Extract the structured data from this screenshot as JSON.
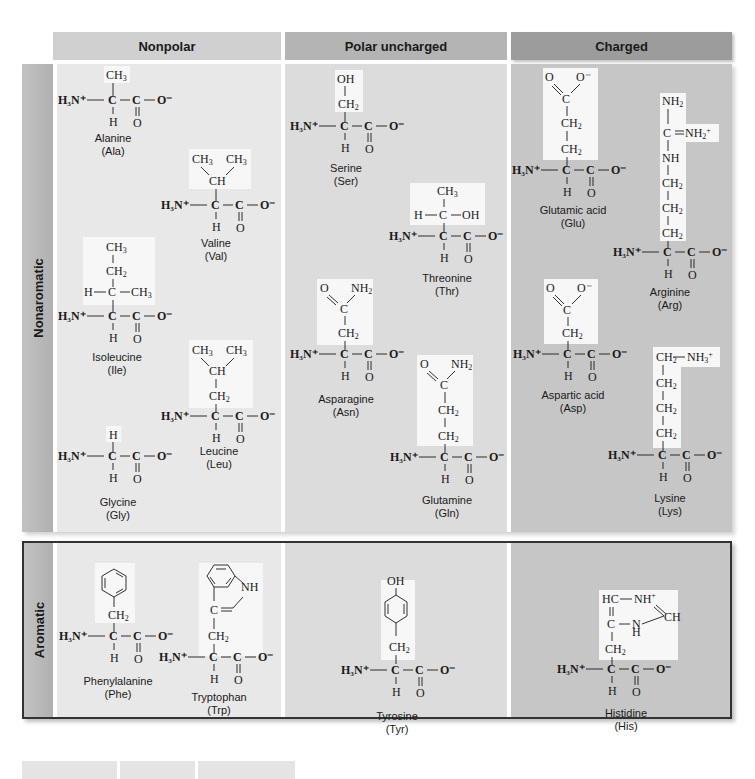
{
  "columns": {
    "nonpolar": "Nonpolar",
    "polar_uncharged": "Polar uncharged",
    "charged": "Charged"
  },
  "rows": {
    "nonaromatic": "Nonaromatic",
    "aromatic": "Aromatic"
  },
  "colors": {
    "nonpolar_header": "#d0d0d0",
    "polar_header": "#b4b4b4",
    "charged_header": "#9c9c9c",
    "nonpolar_cell": "#e8e8e8",
    "polar_cell": "#dcdcdc",
    "charged_cell": "#c6c6c6",
    "sidechain_highlight": "#f7f7f7"
  },
  "backbone": {
    "amine": "H₃N⁺",
    "alpha_c": "C",
    "carboxyl_c": "C",
    "carboxyl_o": "O⁻",
    "h": "H",
    "o": "O"
  },
  "amino_acids": {
    "ala": {
      "name": "Alanine",
      "abbr": "(Ala)",
      "group": "nonpolar",
      "row": "nonaromatic",
      "side_chain": [
        "CH₃"
      ]
    },
    "val": {
      "name": "Valine",
      "abbr": "(Val)",
      "group": "nonpolar",
      "row": "nonaromatic",
      "side_chain": [
        "CH₃",
        "CH₃",
        "CH"
      ]
    },
    "ile": {
      "name": "Isoleucine",
      "abbr": "(Ile)",
      "group": "nonpolar",
      "row": "nonaromatic",
      "side_chain": [
        "CH₃",
        "CH₂",
        "H",
        "C",
        "CH₃"
      ]
    },
    "leu": {
      "name": "Leucine",
      "abbr": "(Leu)",
      "group": "nonpolar",
      "row": "nonaromatic",
      "side_chain": [
        "CH₃",
        "CH₃",
        "CH",
        "CH₂"
      ]
    },
    "gly": {
      "name": "Glycine",
      "abbr": "(Gly)",
      "group": "nonpolar",
      "row": "nonaromatic",
      "side_chain": [
        "H"
      ]
    },
    "ser": {
      "name": "Serine",
      "abbr": "(Ser)",
      "group": "polar_uncharged",
      "row": "nonaromatic",
      "side_chain": [
        "OH",
        "CH₂"
      ]
    },
    "thr": {
      "name": "Threonine",
      "abbr": "(Thr)",
      "group": "polar_uncharged",
      "row": "nonaromatic",
      "side_chain": [
        "CH₃",
        "H",
        "C",
        "OH"
      ]
    },
    "asn": {
      "name": "Asparagine",
      "abbr": "(Asn)",
      "group": "polar_uncharged",
      "row": "nonaromatic",
      "side_chain": [
        "O",
        "NH₂",
        "C",
        "CH₂"
      ]
    },
    "gln": {
      "name": "Glutamine",
      "abbr": "(Gln)",
      "group": "polar_uncharged",
      "row": "nonaromatic",
      "side_chain": [
        "O",
        "NH₂",
        "C",
        "CH₂",
        "CH₂"
      ]
    },
    "glu": {
      "name": "Glutamic acid",
      "abbr": "(Glu)",
      "group": "charged",
      "row": "nonaromatic",
      "side_chain": [
        "O",
        "O⁻",
        "C",
        "CH₂",
        "CH₂"
      ]
    },
    "arg": {
      "name": "Arginine",
      "abbr": "(Arg)",
      "group": "charged",
      "row": "nonaromatic",
      "side_chain": [
        "NH₂",
        "C",
        "=NH₂⁺",
        "NH",
        "CH₂",
        "CH₂",
        "CH₂"
      ]
    },
    "asp": {
      "name": "Aspartic acid",
      "abbr": "(Asp)",
      "group": "charged",
      "row": "nonaromatic",
      "side_chain": [
        "O",
        "O⁻",
        "C",
        "CH₂"
      ]
    },
    "lys": {
      "name": "Lysine",
      "abbr": "(Lys)",
      "group": "charged",
      "row": "nonaromatic",
      "side_chain": [
        "CH₂",
        "NH₃⁺",
        "CH₂",
        "CH₂",
        "CH₂"
      ]
    },
    "phe": {
      "name": "Phenylalanine",
      "abbr": "(Phe)",
      "group": "nonpolar",
      "row": "aromatic",
      "side_chain": [
        "benzene-ring",
        "CH₂"
      ]
    },
    "trp": {
      "name": "Tryptophan",
      "abbr": "(Trp)",
      "group": "nonpolar",
      "row": "aromatic",
      "side_chain": [
        "indole-ring",
        "NH",
        "C=",
        "CH₂"
      ]
    },
    "tyr": {
      "name": "Tyrosine",
      "abbr": "(Tyr)",
      "group": "polar_uncharged",
      "row": "aromatic",
      "side_chain": [
        "OH",
        "benzene-ring",
        "CH₂"
      ]
    },
    "his": {
      "name": "Histidine",
      "abbr": "(His)",
      "group": "charged",
      "row": "aromatic",
      "side_chain": [
        "HC",
        "NH⁺",
        "CH",
        "C",
        "N",
        "H",
        "CH₂"
      ]
    }
  }
}
